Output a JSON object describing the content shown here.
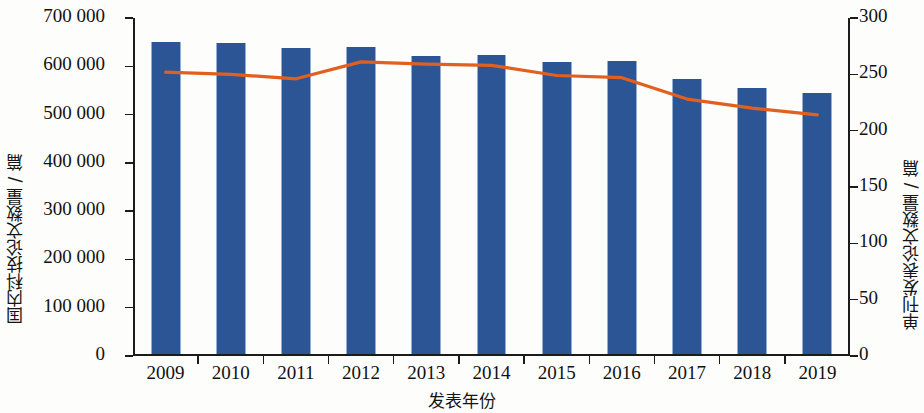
{
  "axes": {
    "x_title": "发表年份",
    "y_left_title": "国内科技论文数量 / 篇",
    "y_right_title": "单刊发表论文数量 / 篇",
    "y_left_ticks": [
      "0",
      "100 000",
      "200 000",
      "300 000",
      "400 000",
      "500 000",
      "600 000",
      "700 000"
    ],
    "y_right_ticks": [
      "0",
      "50",
      "100",
      "150",
      "200",
      "250",
      "300"
    ],
    "x_ticks": [
      "2009",
      "2010",
      "2011",
      "2012",
      "2013",
      "2014",
      "2015",
      "2016",
      "2017",
      "2018",
      "2019"
    ]
  },
  "colors": {
    "bar": "#2c5596",
    "line": "#e1601f",
    "axis": "#1b1b1b",
    "background": "#fdfdfc"
  },
  "chart_data": {
    "type": "bar",
    "title": "",
    "xlabel": "发表年份",
    "ylabel": "国内科技论文数量 / 篇",
    "y2label": "单刊发表论文数量 / 篇",
    "categories": [
      "2009",
      "2010",
      "2011",
      "2012",
      "2013",
      "2014",
      "2015",
      "2016",
      "2017",
      "2018",
      "2019"
    ],
    "ylim": [
      0,
      700000
    ],
    "y2lim": [
      0,
      300
    ],
    "ytick_step": 100000,
    "y2tick_step": 50,
    "grid": false,
    "legend": "none",
    "series": [
      {
        "name": "国内科技论文数量 / 篇",
        "type": "bar",
        "axis": "left",
        "color": "#2c5596",
        "values": [
          648000,
          645000,
          634000,
          637000,
          618000,
          620000,
          605000,
          608000,
          570000,
          552000,
          542000
        ]
      },
      {
        "name": "单刊发表论文数量 / 篇",
        "type": "line",
        "axis": "right",
        "color": "#e1601f",
        "values": [
          252,
          250,
          246,
          261,
          259,
          258,
          249,
          247,
          228,
          220,
          214
        ]
      }
    ]
  }
}
